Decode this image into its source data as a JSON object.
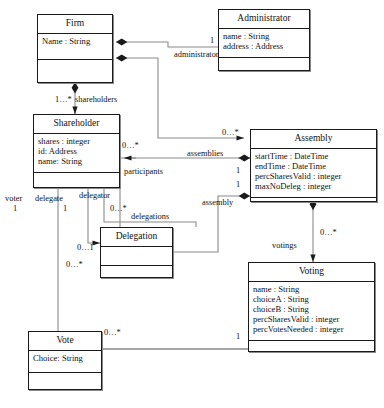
{
  "diagram": {
    "type": "uml-class-diagram",
    "classes": [
      {
        "id": "firm",
        "name": "Firm",
        "attributes": [
          "Name : String"
        ],
        "operations": []
      },
      {
        "id": "administrator",
        "name": "Administrator",
        "attributes": [
          "name : String",
          "address : Address"
        ],
        "operations": []
      },
      {
        "id": "shareholder",
        "name": "Shareholder",
        "attributes": [
          "shares : integer",
          "id: Address",
          "name: String"
        ],
        "operations": []
      },
      {
        "id": "assembly",
        "name": "Assembly",
        "attributes": [
          "startTime : DateTime",
          "endTime : DateTime",
          "percSharesValid : integer",
          "maxNoDeleg : integer"
        ],
        "operations": []
      },
      {
        "id": "delegation",
        "name": "Delegation",
        "attributes": [],
        "operations": []
      },
      {
        "id": "voting",
        "name": "Voting",
        "attributes": [
          "name : String",
          "choiceA : String",
          "choiceB : String",
          "percSharesValid : integer",
          "percVotesNeeded : integer"
        ],
        "operations": []
      },
      {
        "id": "vote",
        "name": "Vote",
        "attributes": [
          "Choice: String"
        ],
        "operations": []
      }
    ],
    "role_labels": [
      {
        "id": "administrator",
        "text": "administrator"
      },
      {
        "id": "shareholders",
        "text": "shareholders"
      },
      {
        "id": "assemblies",
        "text": "assemblies"
      },
      {
        "id": "participants",
        "text": "participants"
      },
      {
        "id": "assembly",
        "text": "assembly"
      },
      {
        "id": "votings",
        "text": "votings"
      },
      {
        "id": "delegations",
        "text": "delegations"
      },
      {
        "id": "voter",
        "text": "voter"
      },
      {
        "id": "delegate",
        "text": "delegate"
      },
      {
        "id": "delegator",
        "text": "delegator"
      }
    ],
    "multiplicities": [
      {
        "id": "admin-one",
        "text": "1"
      },
      {
        "id": "shareholders-many",
        "text": "1…*"
      },
      {
        "id": "assemblies-many",
        "text": "0…*"
      },
      {
        "id": "participants-many",
        "text": "0…*"
      },
      {
        "id": "assembly-one-a",
        "text": "1"
      },
      {
        "id": "assembly-one-b",
        "text": "1"
      },
      {
        "id": "votings-many",
        "text": "0…*"
      },
      {
        "id": "voter-one",
        "text": "1"
      },
      {
        "id": "delegate-one",
        "text": "1"
      },
      {
        "id": "delegator-many",
        "text": "0…*"
      },
      {
        "id": "delegation-zero-one",
        "text": "0…1"
      },
      {
        "id": "delegation-many",
        "text": "0…*"
      },
      {
        "id": "vote-many",
        "text": "0…*"
      },
      {
        "id": "voting-one",
        "text": "1"
      }
    ],
    "colors": {
      "line": "#8a8a8a",
      "border": "#1a1a1a",
      "text": "#111111",
      "background": "#ffffff"
    }
  }
}
